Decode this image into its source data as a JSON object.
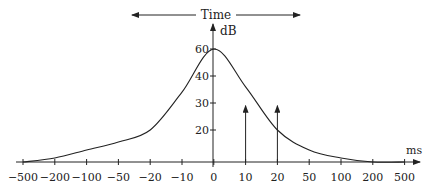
{
  "chart_data": {
    "type": "line",
    "title": "",
    "top_annotation": "Time",
    "xlabel": "ms",
    "ylabel": "dB",
    "x_ticks": [
      "-500",
      "-200",
      "-100",
      "-50",
      "-20",
      "-10",
      "0",
      "10",
      "20",
      "50",
      "100",
      "200",
      "500"
    ],
    "y_ticks": [
      "20",
      "30",
      "40",
      "60"
    ],
    "y_tick_values": [
      20,
      30,
      40,
      60
    ],
    "series": [
      {
        "name": "level",
        "x": [
          "-500",
          "-200",
          "-100",
          "-50",
          "-20",
          "-10",
          "0",
          "10",
          "20",
          "50",
          "100",
          "200",
          "500"
        ],
        "values": [
          12,
          13,
          15,
          17,
          20,
          34,
          60,
          36,
          20,
          15,
          13,
          12,
          12
        ]
      }
    ],
    "markers": [
      {
        "x": "10",
        "top_value": 29,
        "type": "arrow-up"
      },
      {
        "x": "20",
        "top_value": 29,
        "type": "arrow-up"
      }
    ],
    "grid": false,
    "legend": "none"
  }
}
